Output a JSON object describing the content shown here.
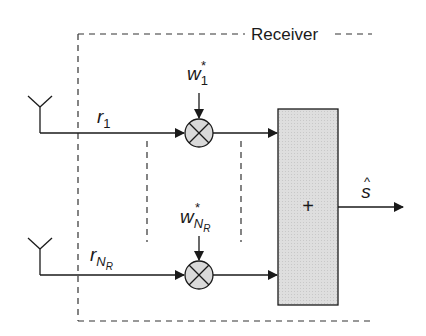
{
  "diagram": {
    "title": "Receiver",
    "type": "block-diagram",
    "branches": [
      {
        "id": "branch-1",
        "input_label": "r",
        "input_sub": "1",
        "weight_label": "w",
        "weight_sub": "1",
        "weight_sup": "*"
      },
      {
        "id": "branch-NR",
        "input_label": "r",
        "input_sub": "N",
        "input_subsub": "R",
        "weight_label": "w",
        "weight_sub": "N",
        "weight_subsub": "R",
        "weight_sup": "*"
      }
    ],
    "combiner": {
      "symbol": "+"
    },
    "output": {
      "label": "s",
      "accent": "^"
    },
    "colors": {
      "line": "#1a1a1a",
      "box_fill": "#dcdcdc",
      "multiplier_fill": "#d9d9d9",
      "dashed": "#333333"
    }
  }
}
